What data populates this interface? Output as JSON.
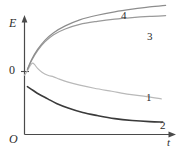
{
  "chart_data": {
    "type": "line",
    "title": "",
    "xlabel": "t",
    "ylabel": "E",
    "origin_label": "O",
    "zero_label": "0",
    "grid": false,
    "legend": "inline-end-labels",
    "axes": {
      "x": {
        "label": "t",
        "arrow": true,
        "range": [
          0,
          1
        ]
      },
      "y": {
        "label": "E",
        "arrow": true,
        "ticks": [
          "0"
        ],
        "zero_fraction": 0.46
      }
    },
    "series": [
      {
        "name": "1",
        "label": "1",
        "color": "#b9b9b9",
        "width": 1.2,
        "description": "rises to a small positive peak near t=0 then decays slowly below zero",
        "points": [
          [
            0.0,
            -0.1
          ],
          [
            0.02,
            0.02
          ],
          [
            0.04,
            0.16
          ],
          [
            0.055,
            0.22
          ],
          [
            0.07,
            0.18
          ],
          [
            0.09,
            0.08
          ],
          [
            0.12,
            -0.02
          ],
          [
            0.16,
            -0.1
          ],
          [
            0.2,
            -0.14
          ],
          [
            0.24,
            -0.2
          ],
          [
            0.3,
            -0.28
          ],
          [
            0.38,
            -0.36
          ],
          [
            0.48,
            -0.44
          ],
          [
            0.6,
            -0.52
          ],
          [
            0.72,
            -0.6
          ],
          [
            0.84,
            -0.66
          ],
          [
            0.94,
            -0.72
          ]
        ]
      },
      {
        "name": "2",
        "label": "2",
        "color": "#3a3a3a",
        "width": 1.6,
        "description": "starts negative and decreases monotonically, flattening at a low plateau",
        "points": [
          [
            0.02,
            -0.4
          ],
          [
            0.06,
            -0.5
          ],
          [
            0.1,
            -0.6
          ],
          [
            0.16,
            -0.72
          ],
          [
            0.22,
            -0.84
          ],
          [
            0.3,
            -0.96
          ],
          [
            0.4,
            -1.08
          ],
          [
            0.5,
            -1.16
          ],
          [
            0.62,
            -1.24
          ],
          [
            0.74,
            -1.29
          ],
          [
            0.86,
            -1.32
          ],
          [
            0.95,
            -1.33
          ]
        ]
      },
      {
        "name": "3",
        "label": "3",
        "color": "#9a9a9a",
        "width": 1.2,
        "description": "rises steeply from near zero then saturates at a high positive plateau",
        "points": [
          [
            0.02,
            0.05
          ],
          [
            0.05,
            0.3
          ],
          [
            0.09,
            0.55
          ],
          [
            0.14,
            0.78
          ],
          [
            0.2,
            0.97
          ],
          [
            0.28,
            1.12
          ],
          [
            0.38,
            1.24
          ],
          [
            0.5,
            1.32
          ],
          [
            0.62,
            1.38
          ],
          [
            0.74,
            1.42
          ],
          [
            0.86,
            1.45
          ],
          [
            0.97,
            1.47
          ]
        ]
      },
      {
        "name": "4",
        "label": "4",
        "color": "#8d8d8d",
        "width": 1.2,
        "description": "rises steeply and continues climbing above curve 3 at large t",
        "points": [
          [
            0.02,
            0.06
          ],
          [
            0.05,
            0.32
          ],
          [
            0.09,
            0.58
          ],
          [
            0.14,
            0.82
          ],
          [
            0.2,
            1.02
          ],
          [
            0.28,
            1.2
          ],
          [
            0.38,
            1.36
          ],
          [
            0.5,
            1.48
          ],
          [
            0.62,
            1.57
          ],
          [
            0.74,
            1.64
          ],
          [
            0.86,
            1.7
          ],
          [
            0.97,
            1.74
          ]
        ]
      }
    ],
    "labels": {
      "y_axis": "E",
      "x_axis": "t",
      "origin": "O",
      "zero_tick": "0",
      "curve_1": "1",
      "curve_2": "2",
      "curve_3": "3",
      "curve_4": "4"
    },
    "colors": {
      "axis": "#4a4a4a",
      "curve_1": "#b9b9b9",
      "curve_2": "#3a3a3a",
      "curve_3": "#9a9a9a",
      "curve_4": "#8d8d8d",
      "background": "#ffffff"
    }
  }
}
